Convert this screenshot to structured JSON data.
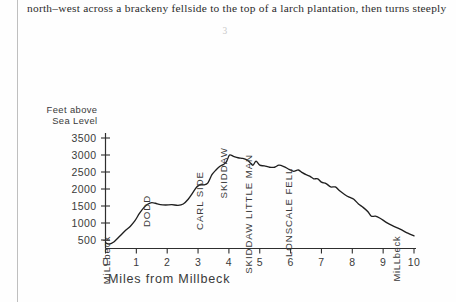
{
  "page": {
    "body_text": "north–west across a brackeny fellside to the top of a larch plantation, then turns steeply",
    "folio": "3"
  },
  "chart_data": {
    "type": "line",
    "title": "",
    "xlabel": "Miles from Millbeck",
    "ylabel": "Feet above Sea Level",
    "ylabel_line1": "Feet above",
    "ylabel_line2": "Sea Level",
    "xlim": [
      0,
      10
    ],
    "ylim": [
      0,
      3500
    ],
    "grid": false,
    "legend": "none",
    "xticks": [
      "0",
      "1",
      "2",
      "3",
      "4",
      "5",
      "6",
      "7",
      "8",
      "9",
      "10"
    ],
    "xtick_values": [
      0,
      1,
      2,
      3,
      4,
      5,
      6,
      7,
      8,
      9,
      10
    ],
    "yticks": [
      "500",
      "1000",
      "1500",
      "2000",
      "2500",
      "3000",
      "3500"
    ],
    "ytick_values": [
      500,
      1000,
      1500,
      2000,
      2500,
      3000,
      3500
    ],
    "annotations": [
      {
        "label": "MiLLbeck",
        "x": 0.15,
        "y": 450,
        "orientation": "vertical"
      },
      {
        "label": "DODD",
        "x": 1.45,
        "y": 1650,
        "orientation": "vertical"
      },
      {
        "label": "CARL SIDE",
        "x": 3.15,
        "y": 2350,
        "orientation": "vertical"
      },
      {
        "label": "SKIDDAW",
        "x": 3.95,
        "y": 3050,
        "orientation": "vertical"
      },
      {
        "label": "SKIDDAW LITTLE MAN",
        "x": 4.75,
        "y": 2850,
        "orientation": "vertical"
      },
      {
        "label": "LONSCALE FELL",
        "x": 6.05,
        "y": 2450,
        "orientation": "vertical"
      }
    ],
    "endpoint_labels": [
      {
        "label": "MiLLbeck",
        "x": 9.55,
        "y": 450
      }
    ],
    "series": [
      {
        "name": "Skiddaw ridge profile",
        "x": [
          0.0,
          0.12,
          0.28,
          0.45,
          0.62,
          0.8,
          0.95,
          1.1,
          1.25,
          1.38,
          1.5,
          1.62,
          1.78,
          1.95,
          2.15,
          2.35,
          2.52,
          2.68,
          2.82,
          2.95,
          3.05,
          3.12,
          3.2,
          3.32,
          3.45,
          3.58,
          3.7,
          3.82,
          3.92,
          4.02,
          4.15,
          4.3,
          4.45,
          4.58,
          4.68,
          4.78,
          4.88,
          5.0,
          5.15,
          5.32,
          5.48,
          5.62,
          5.78,
          5.95,
          6.1,
          6.25,
          6.38,
          6.5,
          6.62,
          6.75,
          6.88,
          7.0,
          7.15,
          7.3,
          7.45,
          7.6,
          7.75,
          7.9,
          8.05,
          8.2,
          8.35,
          8.5,
          8.62,
          8.75,
          8.9,
          9.1,
          9.3,
          9.55,
          9.8,
          10.0
        ],
        "values": [
          420,
          380,
          450,
          600,
          760,
          900,
          1060,
          1280,
          1460,
          1560,
          1600,
          1580,
          1540,
          1530,
          1540,
          1520,
          1560,
          1700,
          1880,
          2050,
          2120,
          2140,
          2120,
          2180,
          2420,
          2560,
          2660,
          2720,
          2800,
          3000,
          2960,
          2920,
          2900,
          2860,
          2780,
          2700,
          2820,
          2700,
          2680,
          2640,
          2640,
          2700,
          2660,
          2580,
          2520,
          2560,
          2480,
          2420,
          2380,
          2300,
          2300,
          2200,
          2160,
          2060,
          2060,
          1940,
          1840,
          1760,
          1700,
          1560,
          1460,
          1340,
          1200,
          1200,
          1140,
          1020,
          920,
          820,
          700,
          620
        ]
      }
    ]
  }
}
